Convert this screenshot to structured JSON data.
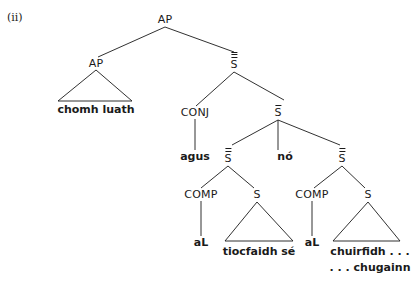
{
  "example_label": "(ii)",
  "tree": {
    "root": {
      "label": "AP"
    },
    "left_ap": {
      "label": "AP",
      "yield": "chomh luath"
    },
    "s_triple_bar": {
      "label": "S",
      "bars": 3
    },
    "conj": {
      "label": "CONJ",
      "word": "agus"
    },
    "s_single_bar": {
      "label": "S",
      "bars": 1
    },
    "s_double_bar_left": {
      "label": "S",
      "bars": 2
    },
    "disjunction": {
      "word": "nó"
    },
    "s_double_bar_right": {
      "label": "S",
      "bars": 2
    },
    "comp_left": {
      "label": "COMP",
      "word": "aL"
    },
    "s_left": {
      "label": "S",
      "yield": "tiocfaidh sé"
    },
    "comp_right": {
      "label": "COMP",
      "word": "aL"
    },
    "s_right": {
      "label": "S",
      "yield_line1": "chuirfidh . . .",
      "yield_line2": ". . . chugainn"
    }
  },
  "colors": {
    "ink": "#1a1a1a",
    "background": "#ffffff"
  }
}
